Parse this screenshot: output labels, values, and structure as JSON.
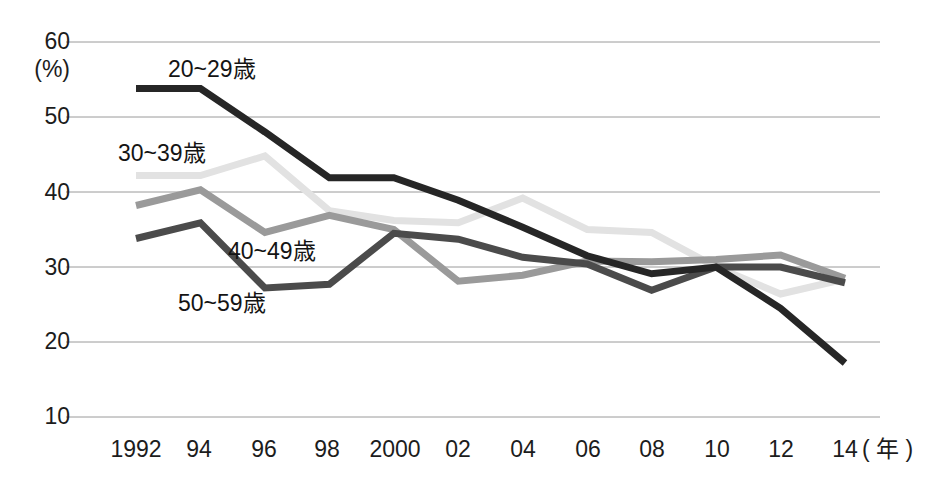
{
  "chart_data": {
    "type": "line",
    "title": "",
    "subtitle": "",
    "xlabel": "年",
    "ylabel": "(%)",
    "ylim": [
      10,
      60
    ],
    "ytick_labels": [
      "60",
      "50",
      "40",
      "30",
      "20",
      "10"
    ],
    "ytick_values": [
      60,
      50,
      40,
      30,
      20,
      10
    ],
    "grid": true,
    "legend_position": "inline-annotations",
    "x": [
      1992,
      1994,
      1996,
      1998,
      2000,
      2002,
      2004,
      2006,
      2008,
      2010,
      2012,
      2014
    ],
    "xtick_labels": [
      "1992",
      "94",
      "96",
      "98",
      "2000",
      "02",
      "04",
      "06",
      "08",
      "10",
      "12",
      "14"
    ],
    "series": [
      {
        "name": "20~29歳",
        "label": "20~29歳",
        "color": "#262626",
        "values": [
          53.8,
          53.8,
          48.0,
          41.9,
          41.9,
          38.9,
          35.3,
          31.5,
          29.1,
          30.0,
          24.5,
          17.2
        ]
      },
      {
        "name": "30~39歳",
        "label": "30~39歳",
        "color": "#e2e2e2",
        "values": [
          42.2,
          42.2,
          44.8,
          37.5,
          36.2,
          35.9,
          39.2,
          35.0,
          34.6,
          30.0,
          26.4,
          28.4
        ]
      },
      {
        "name": "40~49歳",
        "label": "40~49歳",
        "color": "#9a9a9a",
        "values": [
          38.2,
          40.3,
          34.6,
          36.9,
          35.0,
          28.1,
          28.9,
          30.8,
          30.7,
          31.0,
          31.6,
          28.5
        ]
      },
      {
        "name": "50~59歳",
        "label": "50~59歳",
        "color": "#4b4b4b",
        "values": [
          33.8,
          35.9,
          27.2,
          27.7,
          34.5,
          33.7,
          31.3,
          30.4,
          26.9,
          30.0,
          30.0,
          27.9
        ]
      }
    ],
    "annotations": [
      {
        "text": "20~29歳",
        "x_px": 168,
        "y_px": 58
      },
      {
        "text": "30~39歳",
        "x_px": 118,
        "y_px": 142
      },
      {
        "text": "40~49歳",
        "x_px": 228,
        "y_px": 240
      },
      {
        "text": "50~59歳",
        "x_px": 178,
        "y_px": 292
      }
    ]
  },
  "axis": {
    "unit": "(%)",
    "x_unit_label": "( 年 )"
  }
}
